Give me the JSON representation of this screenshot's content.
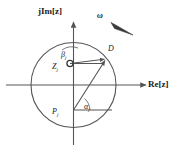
{
  "figure": {
    "background": "#ffffff",
    "stroke_color": "#555555",
    "text_color": "#1a1a1a",
    "width": 179,
    "height": 157
  },
  "axes": {
    "imaginary": {
      "label": "jIm[z]",
      "icon": "up-arrow-axis",
      "x": 73.5,
      "y_top": 22,
      "y_bottom": 145
    },
    "real": {
      "label": "Re[z]",
      "icon": "right-arrow-axis",
      "y": 85,
      "x_left": 6,
      "x_right": 146
    }
  },
  "unit_circle": {
    "name": "unit-circle",
    "cx": 73.5,
    "cy": 85,
    "r": 42.5
  },
  "points": {
    "D": {
      "label": "D",
      "x": 106.5,
      "y": 58.5,
      "description": "point on unit circle"
    },
    "zero": {
      "label": "Z",
      "subscript": "j",
      "marker": "open-circle-zero-marker",
      "x": 70,
      "y": 63.5
    },
    "pole": {
      "label": "P",
      "subscript": "j",
      "marker": "pole-vertex",
      "x": 73.5,
      "y": 110
    }
  },
  "angles": {
    "beta": {
      "symbol": "β",
      "subscript": "j",
      "description": "angle at zero Z_j between horizontal reference and vector to D"
    },
    "alpha": {
      "symbol": "α",
      "subscript": "j",
      "description": "angle at pole P_j between horizontal reference and vector to D"
    }
  },
  "rotation": {
    "symbol": "ω",
    "arrow": "tapered-arrow-pointing-down-left",
    "tail_x": 131,
    "tail_y": 33,
    "head_x": 112,
    "head_y": 24,
    "description": "angular frequency direction along the unit circle"
  },
  "reference_lines": {
    "zero_horizontal": {
      "x1": 70,
      "y1": 63.5,
      "x2": 104,
      "y2": 63.5
    },
    "pole_horizontal": {
      "x1": 73.5,
      "y1": 110,
      "x2": 112,
      "y2": 110
    }
  },
  "vectors": {
    "zero_to_D": {
      "x1": 70,
      "y1": 63.5,
      "x2": 106.5,
      "y2": 58.5
    },
    "pole_to_D": {
      "x1": 73.5,
      "y1": 110,
      "x2": 106.5,
      "y2": 58.5
    }
  }
}
